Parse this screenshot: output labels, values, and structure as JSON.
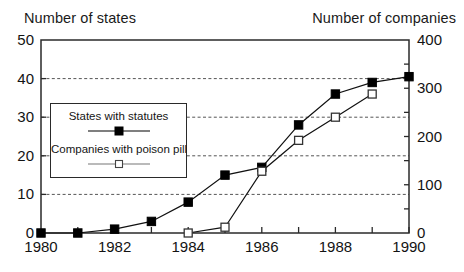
{
  "titles": {
    "left_axis": "Number of states",
    "right_axis": "Number of companies"
  },
  "colors": {
    "ink": "#000000",
    "frame": "#2a2a2a",
    "grid": "#555555",
    "background": "#ffffff",
    "series_states": "#000000",
    "series_companies": "#ffffff"
  },
  "legend": {
    "states_label": "States with statutes",
    "companies_label": "Companies with poison pill"
  },
  "chart_data": {
    "type": "line",
    "title": "",
    "subtitle": "",
    "xlabel": "",
    "ylabel": "Number of states",
    "y2label": "Number of companies",
    "x": [
      1980,
      1981,
      1982,
      1983,
      1984,
      1985,
      1986,
      1987,
      1988,
      1989,
      1990
    ],
    "xlim": [
      1980,
      1990
    ],
    "ylim": [
      0,
      50
    ],
    "y2lim": [
      0,
      400
    ],
    "xticks": [
      1980,
      1982,
      1984,
      1986,
      1988,
      1990
    ],
    "xtick_labels": [
      "1980",
      "1982",
      "1984",
      "1986",
      "1988",
      "1990"
    ],
    "xminor_ticks": [
      1981,
      1983,
      1985,
      1987,
      1989
    ],
    "yticks": [
      0,
      10,
      20,
      30,
      40,
      50
    ],
    "ytick_labels": [
      "0",
      "10",
      "20",
      "30",
      "40",
      "50"
    ],
    "y2ticks": [
      0,
      100,
      200,
      300,
      400
    ],
    "y2tick_labels": [
      "0",
      "100",
      "200",
      "300",
      "400"
    ],
    "y2minor_ticks": [
      50,
      150,
      250,
      350
    ],
    "grid": true,
    "gridlines_at": [
      10,
      20,
      30,
      40
    ],
    "grid_style": "dashed",
    "legend_position": "inside upper-left",
    "series": [
      {
        "name": "States with statutes",
        "axis": "left",
        "marker": "filled-square",
        "x": [
          1980,
          1981,
          1982,
          1983,
          1984,
          1985,
          1986,
          1987,
          1988,
          1989,
          1990
        ],
        "values": [
          0,
          0,
          1,
          3,
          8,
          15,
          17,
          28,
          36,
          39,
          40.5
        ]
      },
      {
        "name": "Companies with poison pill",
        "axis": "right",
        "marker": "open-square",
        "x": [
          1984,
          1985,
          1986,
          1987,
          1988,
          1989
        ],
        "values": [
          0,
          12,
          128,
          192,
          240,
          288
        ]
      }
    ]
  }
}
